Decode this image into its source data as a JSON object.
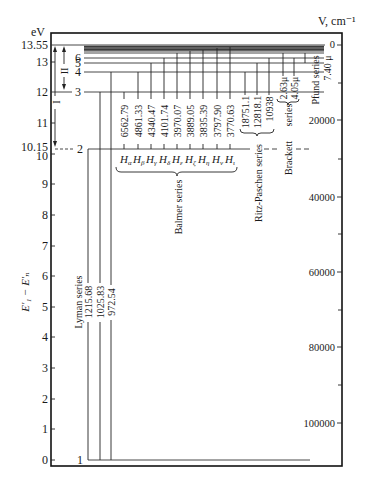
{
  "left_axis": {
    "unit": "eV",
    "title": "E′₁ − E′ₙ",
    "ticks": [
      "13.55",
      "13",
      "12",
      "11",
      "10.15",
      "10",
      "9",
      "8",
      "7",
      "6",
      "5",
      "4",
      "3",
      "2",
      "1",
      "0"
    ]
  },
  "right_axis": {
    "unit": "V, cm⁻¹",
    "ticks": [
      "0",
      "20000",
      "40000",
      "60000",
      "80000",
      "100000"
    ]
  },
  "levels": {
    "n1": "1",
    "n2": "2",
    "n3": "3",
    "n4": "4",
    "n5": "5",
    "n6": "6"
  },
  "arrows": {
    "ionization_label": "I",
    "excitation_label": "II"
  },
  "series": {
    "lyman": {
      "name": "Lyman series",
      "lines": [
        "1215.68",
        "1025.83",
        "972.54"
      ]
    },
    "balmer": {
      "name": "Balmer series",
      "lines": [
        "6562.79",
        "4861.33",
        "4340.47",
        "4101.74",
        "3970.07",
        "3889.05",
        "3835.39",
        "3797.90",
        "3770.63"
      ],
      "symbol_base": "H",
      "symbols": [
        "α",
        "β",
        "γ",
        "δ",
        "ε",
        "ζ",
        "η",
        "ν",
        "ι"
      ]
    },
    "paschen": {
      "name": "Ritz-Paschen series",
      "lines": [
        "18751.1",
        "12818.1",
        "10938"
      ]
    },
    "brackett": {
      "name": "Brackett",
      "name_suffix": "series",
      "lines": [
        "2.63μ",
        "4.05μ"
      ]
    },
    "pfund": {
      "name": "Pfund series",
      "lines": [
        "7.40 μ"
      ]
    }
  }
}
